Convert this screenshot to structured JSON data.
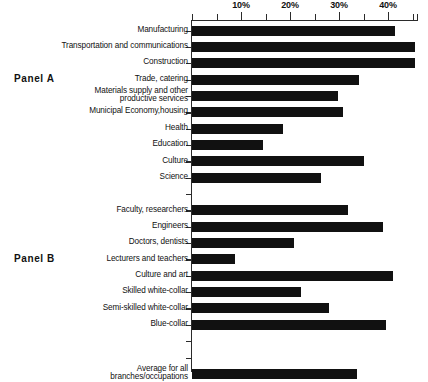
{
  "figure": {
    "panel_a_label": "Panel A",
    "panel_b_label": "Panel B"
  },
  "chart_data": {
    "type": "bar",
    "orientation": "horizontal",
    "title": "",
    "xlabel": "",
    "ylabel": "",
    "xlim": [
      0,
      46.5
    ],
    "grid": false,
    "legend": null,
    "tick_labels": [
      "10%",
      "20%",
      "30%",
      "40%"
    ],
    "tick_values": [
      10,
      20,
      30,
      40
    ],
    "minor_tick_values": [
      0,
      5,
      15,
      25,
      35,
      45
    ],
    "panels": [
      {
        "name": "Panel A",
        "categories": [
          "Manufacturing",
          "Transportation and communications",
          "Construction",
          "Trade, catering",
          "Materials supply and other\nproductive services",
          "Municipal Economy,housing",
          "Health",
          "Education",
          "Culture",
          "Science"
        ],
        "values": [
          41.4,
          45.5,
          45.5,
          34.0,
          29.8,
          30.8,
          18.5,
          14.4,
          35.2,
          26.3
        ]
      },
      {
        "name": "Panel B",
        "categories": [
          "Faculty, researchers",
          "Engineers",
          "Doctors, dentists",
          "Lecturers and teachers",
          "Culture and art",
          "Skilled white-collar",
          "Semi-skilled white-collar",
          "Blue-collar"
        ],
        "values": [
          31.9,
          38.9,
          20.9,
          8.7,
          41.0,
          22.2,
          28.0,
          39.6
        ]
      },
      {
        "name": "Average",
        "categories": [
          "Average for all\nbranches/occupations"
        ],
        "values": [
          33.6
        ]
      }
    ]
  }
}
